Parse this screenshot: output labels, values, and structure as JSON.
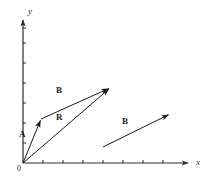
{
  "figure": {
    "name": "vector-addition-diagram",
    "width": 208,
    "height": 178,
    "background_color": "#ffffff",
    "stroke_color": "#1a1a1a",
    "axis_color": "#2b2b2b"
  },
  "axes": {
    "x_label": "x",
    "y_label": "y",
    "origin_label": "0",
    "origin": {
      "x": 23,
      "y": 163
    },
    "x_axis": {
      "x1": 23,
      "y1": 163,
      "x2": 190,
      "y2": 163
    },
    "y_axis": {
      "x1": 23,
      "y1": 163,
      "x2": 23,
      "y2": 18
    },
    "x_ticks": [
      43,
      63,
      83,
      103,
      123,
      143,
      163
    ],
    "y_ticks": [
      143,
      123,
      103,
      83,
      63,
      43,
      28
    ],
    "tick_length": 3
  },
  "vectors": [
    {
      "label": "A",
      "name": "vector-a",
      "from": {
        "x": 23,
        "y": 163
      },
      "to": {
        "x": 41,
        "y": 119
      },
      "label_pos": {
        "x": 19,
        "y": 130
      }
    },
    {
      "label": "B",
      "name": "vector-b-head-to-tail",
      "from": {
        "x": 41,
        "y": 119
      },
      "to": {
        "x": 110,
        "y": 88
      },
      "label_pos": {
        "x": 56,
        "y": 86
      }
    },
    {
      "label": "R",
      "name": "vector-r-resultant",
      "from": {
        "x": 23,
        "y": 163
      },
      "to": {
        "x": 110,
        "y": 88
      },
      "label_pos": {
        "x": 56,
        "y": 113
      }
    },
    {
      "label": "B",
      "name": "vector-b-translated",
      "from": {
        "x": 103,
        "y": 147
      },
      "to": {
        "x": 170,
        "y": 114
      },
      "label_pos": {
        "x": 122,
        "y": 117
      }
    }
  ],
  "chart_data": {
    "type": "scatter",
    "title": "",
    "xlabel": "x",
    "ylabel": "y",
    "grid": false,
    "legend": "none",
    "series": [
      {
        "name": "A",
        "start": [
          0,
          0
        ],
        "end": [
          0.9,
          2.2
        ]
      },
      {
        "name": "B",
        "start": [
          0.9,
          2.2
        ],
        "end": [
          4.35,
          3.75
        ]
      },
      {
        "name": "R",
        "start": [
          0,
          0
        ],
        "end": [
          4.35,
          3.75
        ]
      },
      {
        "name": "B (translated)",
        "start": [
          4.0,
          0.8
        ],
        "end": [
          7.35,
          2.45
        ]
      }
    ]
  }
}
